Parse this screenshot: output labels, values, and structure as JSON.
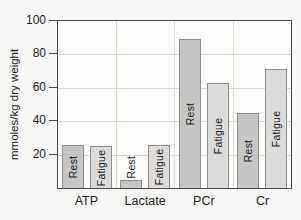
{
  "chart_data": {
    "type": "bar",
    "title": "",
    "xlabel": "",
    "ylabel": "mmoles/kg dry weight",
    "ylim": [
      0,
      100
    ],
    "yticks": [
      20,
      40,
      60,
      80,
      100
    ],
    "grid": true,
    "legend_position": "none (series labels printed vertically inside each bar)",
    "categories": [
      "ATP",
      "Lactate",
      "PCr",
      "Cr"
    ],
    "series": [
      {
        "name": "Rest",
        "values": [
          26,
          5,
          89,
          45
        ],
        "fill": "#c6c5c3",
        "stroke": "#8f8e8c"
      },
      {
        "name": "Fatigue",
        "values": [
          25,
          26,
          63,
          71
        ],
        "fill": "#dcdbd9",
        "stroke": "#8f8e8c"
      }
    ],
    "colors": {
      "gridline": "#d9d9d6",
      "axis": "#4d4d4d",
      "text": "#1c1c1c",
      "plot_background": "#fcfcfb",
      "page_background": "#f7f7f5"
    }
  }
}
